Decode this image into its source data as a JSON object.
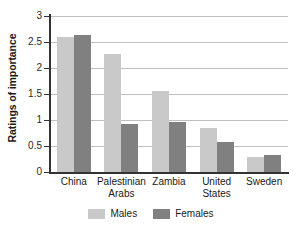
{
  "chart_data": {
    "type": "bar",
    "title": "",
    "xlabel": "",
    "ylabel": "Ratings of importance",
    "categories": [
      "China",
      "Palestinian Arabs",
      "Zambia",
      "United States",
      "Sweden"
    ],
    "category_lines": [
      [
        "China"
      ],
      [
        "Palestinian",
        "Arabs"
      ],
      [
        "Zambia"
      ],
      [
        "United",
        "States"
      ],
      [
        "Sweden"
      ]
    ],
    "series": [
      {
        "name": "Males",
        "color": "#c9c9c9",
        "values": [
          2.59,
          2.26,
          1.56,
          0.85,
          0.28
        ]
      },
      {
        "name": "Females",
        "color": "#808080",
        "values": [
          2.64,
          0.93,
          0.96,
          0.57,
          0.33
        ]
      }
    ],
    "ylim": [
      0,
      3
    ],
    "yticks": [
      0,
      0.5,
      1,
      1.5,
      2,
      2.5,
      3
    ],
    "ytick_labels": [
      "0",
      "0.5",
      "1",
      "1.5",
      "2",
      "2.5",
      "3"
    ],
    "grid": true,
    "grid_color": "#bfbfbf",
    "axis_color": "#333333",
    "legend": {
      "position": "bottom",
      "entries": [
        {
          "label": "Males",
          "color": "#c9c9c9"
        },
        {
          "label": "Females",
          "color": "#808080"
        }
      ]
    }
  }
}
